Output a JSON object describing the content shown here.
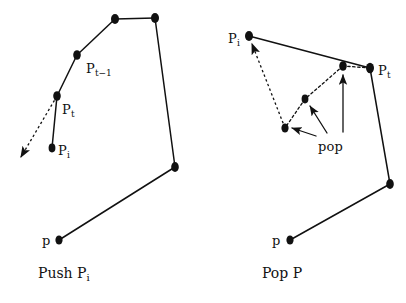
{
  "figure": {
    "background_color": "#ffffff",
    "stroke_color": "#111111",
    "vertex_color": "#111111"
  },
  "panels": [
    {
      "id": "push-panel",
      "caption_main": "Push P",
      "caption_sub": "i",
      "caption_x": 38,
      "caption_y": 266,
      "labels": [
        {
          "name": "label-pt-minus-1",
          "main": "P",
          "sub": "t−1",
          "x": 86,
          "y": 62
        },
        {
          "name": "label-pt",
          "main": "P",
          "sub": "t",
          "x": 62,
          "y": 103
        },
        {
          "name": "label-pi",
          "main": "P",
          "sub": "i",
          "x": 58,
          "y": 144
        },
        {
          "name": "label-p",
          "main": "p",
          "sub": "",
          "x": 42,
          "y": 234
        }
      ],
      "vertices": [
        {
          "name": "vertex-p",
          "x": 59,
          "y": 240
        },
        {
          "name": "vertex-right",
          "x": 175,
          "y": 167
        },
        {
          "name": "vertex-top-right",
          "x": 155,
          "y": 18
        },
        {
          "name": "vertex-top-left",
          "x": 115,
          "y": 19
        },
        {
          "name": "vertex-pt-minus-1",
          "x": 77,
          "y": 55
        },
        {
          "name": "vertex-pt",
          "x": 57,
          "y": 96
        },
        {
          "name": "vertex-pi",
          "x": 52,
          "y": 148
        }
      ],
      "solid_path": [
        [
          59,
          240
        ],
        [
          175,
          167
        ],
        [
          155,
          18
        ],
        [
          115,
          19
        ],
        [
          77,
          55
        ],
        [
          57,
          96
        ],
        [
          52,
          148
        ]
      ],
      "dashed_arrows": [
        {
          "name": "dashed-arrow-pt-outward",
          "from": [
            57,
            96
          ],
          "to": [
            18,
            160
          ]
        }
      ],
      "solid_arrows": []
    },
    {
      "id": "pop-panel",
      "caption_main": "Pop P",
      "caption_sub": "",
      "caption_x": 262,
      "caption_y": 266,
      "labels": [
        {
          "name": "label-pi",
          "main": "P",
          "sub": "i",
          "x": 228,
          "y": 32
        },
        {
          "name": "label-pt",
          "main": "P",
          "sub": "t",
          "x": 378,
          "y": 64
        },
        {
          "name": "label-pop",
          "main": "pop",
          "sub": "",
          "x": 318,
          "y": 140
        },
        {
          "name": "label-p",
          "main": "p",
          "sub": "",
          "x": 272,
          "y": 234
        }
      ],
      "vertices": [
        {
          "name": "vertex-pi",
          "x": 249,
          "y": 36
        },
        {
          "name": "vertex-pt",
          "x": 370,
          "y": 68
        },
        {
          "name": "vertex-inner-top",
          "x": 343,
          "y": 66
        },
        {
          "name": "vertex-inner-mid",
          "x": 305,
          "y": 99
        },
        {
          "name": "vertex-inner-low",
          "x": 285,
          "y": 128
        },
        {
          "name": "vertex-lower-right",
          "x": 390,
          "y": 184
        },
        {
          "name": "vertex-p",
          "x": 290,
          "y": 240
        }
      ],
      "solid_path": [
        [
          249,
          36
        ],
        [
          370,
          68
        ],
        [
          390,
          184
        ],
        [
          290,
          240
        ]
      ],
      "dashed_path": [
        [
          370,
          68
        ],
        [
          343,
          66
        ],
        [
          305,
          99
        ],
        [
          285,
          128
        ],
        [
          249,
          36
        ]
      ],
      "dashed_arrows": [
        {
          "name": "dashed-arrow-to-pi",
          "from": [
            285,
            128
          ],
          "to": [
            251,
            41
          ]
        }
      ],
      "solid_arrows": [
        {
          "name": "pop-arrow-to-inner-low",
          "from": [
            316,
            136
          ],
          "to": [
            290,
            127
          ]
        },
        {
          "name": "pop-arrow-to-inner-mid",
          "from": [
            327,
            133
          ],
          "to": [
            310,
            104
          ]
        },
        {
          "name": "pop-arrow-to-inner-top",
          "from": [
            343,
            134
          ],
          "to": [
            343,
            73
          ]
        }
      ]
    }
  ]
}
